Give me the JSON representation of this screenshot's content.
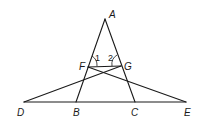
{
  "diagram": {
    "type": "geometry",
    "points": {
      "A": {
        "x": 105,
        "y": 19
      },
      "F": {
        "x": 88,
        "y": 67
      },
      "G": {
        "x": 121,
        "y": 66
      },
      "D": {
        "x": 24,
        "y": 102
      },
      "B": {
        "x": 76,
        "y": 102
      },
      "C": {
        "x": 135,
        "y": 102
      },
      "E": {
        "x": 186,
        "y": 102
      }
    },
    "labels": {
      "A": "A",
      "F": "F",
      "G": "G",
      "D": "D",
      "B": "B",
      "C": "C",
      "E": "E"
    },
    "angle_labels": {
      "angle1": "1",
      "angle2": "2"
    },
    "segments": [
      "AB",
      "AC",
      "DE",
      "FG",
      "DG",
      "FE"
    ]
  }
}
